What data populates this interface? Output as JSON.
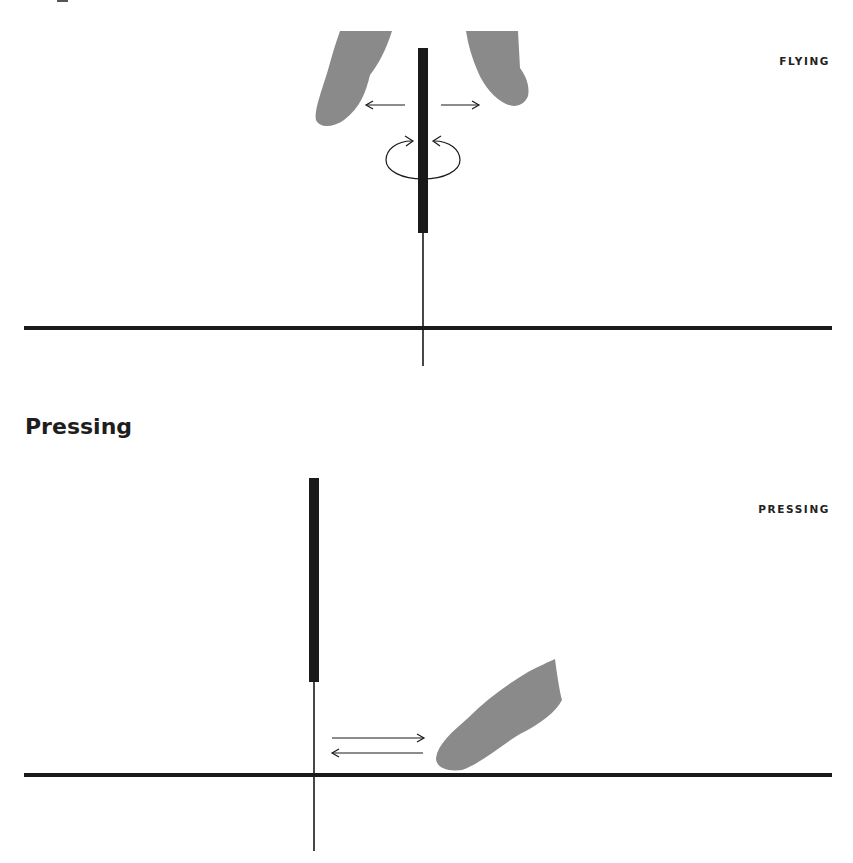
{
  "panels": {
    "flying": {
      "state_label": "FLYING",
      "gestures": [
        "spread-fingers-apart",
        "rotate-pen"
      ]
    },
    "pressing": {
      "heading": "Pressing",
      "state_label": "PRESSING",
      "gestures": [
        "slide-finger-back-and-forth"
      ]
    }
  },
  "colors": {
    "background": "#ffffff",
    "line": "#1a1a1a",
    "finger": "#8a8a8a",
    "text": "#222222"
  }
}
